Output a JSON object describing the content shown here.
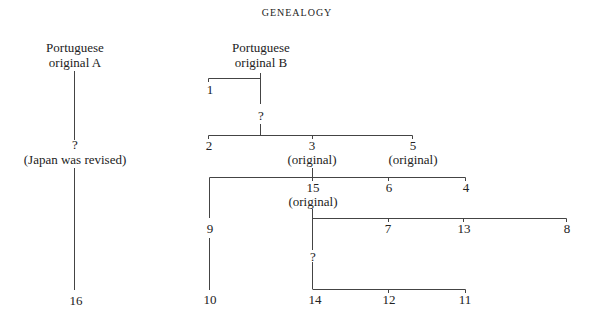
{
  "title": "GENEALOGY",
  "nodes": {
    "origA": {
      "line1": "Portuguese",
      "line2": "original A"
    },
    "origB": {
      "line1": "Portuguese",
      "line2": "original B"
    },
    "qA": "?",
    "japan": "(Japan was revised)",
    "n1": "1",
    "qB": "?",
    "n2": "2",
    "n3": "3",
    "n3note": "(original)",
    "n5": "5",
    "n5note": "(original)",
    "n15": "15",
    "n15note": "(original)",
    "n6": "6",
    "n4": "4",
    "n9": "9",
    "n7": "7",
    "n13": "13",
    "n8": "8",
    "q15": "?",
    "n16": "16",
    "n10": "10",
    "n14": "14",
    "n12": "12",
    "n11": "11"
  }
}
